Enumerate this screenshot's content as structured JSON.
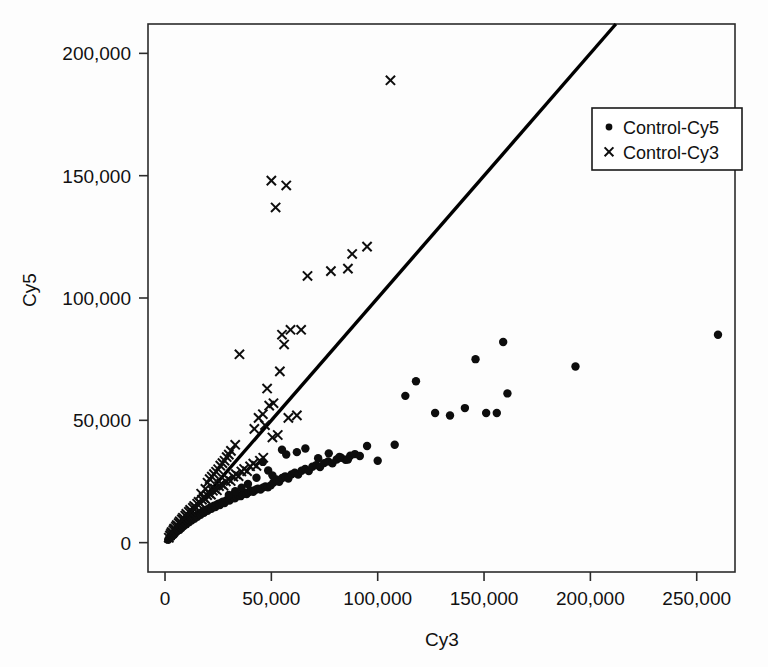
{
  "chart_data": {
    "type": "scatter",
    "title": "",
    "xlabel": "Cy3",
    "ylabel": "Cy5",
    "xlim": [
      -8000,
      268000
    ],
    "ylim": [
      -12000,
      212000
    ],
    "xticks": [
      0,
      50000,
      100000,
      150000,
      200000,
      250000
    ],
    "yticks": [
      0,
      50000,
      100000,
      150000,
      200000
    ],
    "xticklabels": [
      "0",
      "50,000",
      "100,000",
      "150,000",
      "200,000",
      "250,000"
    ],
    "yticklabels": [
      "0",
      "50,000",
      "100,000",
      "150,000",
      "200,000"
    ],
    "grid": false,
    "legend_position": "upper right",
    "reference_line": {
      "name": "identity-line",
      "slope": 1.0,
      "intercept": 0,
      "x_from": 0,
      "x_to": 212000
    },
    "series": [
      {
        "name": "Control-Cy5",
        "marker": "dot",
        "color": "#0d0d0d",
        "points": [
          [
            1500,
            1200
          ],
          [
            2000,
            1800
          ],
          [
            2400,
            2100
          ],
          [
            2800,
            2600
          ],
          [
            3100,
            2400
          ],
          [
            3400,
            3000
          ],
          [
            3700,
            3300
          ],
          [
            4000,
            3100
          ],
          [
            4300,
            3800
          ],
          [
            4600,
            4100
          ],
          [
            4900,
            3900
          ],
          [
            5200,
            4600
          ],
          [
            5500,
            4900
          ],
          [
            5800,
            4700
          ],
          [
            6100,
            5400
          ],
          [
            6500,
            5600
          ],
          [
            6800,
            5200
          ],
          [
            7100,
            6100
          ],
          [
            7400,
            6400
          ],
          [
            7800,
            6000
          ],
          [
            8100,
            6900
          ],
          [
            8500,
            7200
          ],
          [
            8800,
            6800
          ],
          [
            9200,
            7600
          ],
          [
            9600,
            7900
          ],
          [
            10000,
            7500
          ],
          [
            10400,
            8400
          ],
          [
            10800,
            8700
          ],
          [
            11200,
            8300
          ],
          [
            11600,
            9100
          ],
          [
            12000,
            9500
          ],
          [
            12400,
            9000
          ],
          [
            12900,
            9900
          ],
          [
            13300,
            10300
          ],
          [
            13800,
            9800
          ],
          [
            14200,
            10700
          ],
          [
            14700,
            11100
          ],
          [
            15200,
            10600
          ],
          [
            15700,
            11500
          ],
          [
            16200,
            11900
          ],
          [
            16700,
            11400
          ],
          [
            17200,
            12300
          ],
          [
            17800,
            12700
          ],
          [
            18300,
            12200
          ],
          [
            18900,
            13100
          ],
          [
            19400,
            13500
          ],
          [
            20000,
            13000
          ],
          [
            20600,
            13900
          ],
          [
            21200,
            14300
          ],
          [
            21800,
            13800
          ],
          [
            22400,
            14700
          ],
          [
            23100,
            15100
          ],
          [
            23700,
            14600
          ],
          [
            24400,
            15500
          ],
          [
            25100,
            15900
          ],
          [
            25800,
            15400
          ],
          [
            26500,
            16300
          ],
          [
            27200,
            16700
          ],
          [
            28000,
            16200
          ],
          [
            28700,
            17100
          ],
          [
            29500,
            17600
          ],
          [
            30300,
            17200
          ],
          [
            31100,
            18000
          ],
          [
            32000,
            18500
          ],
          [
            32800,
            18100
          ],
          [
            33700,
            18900
          ],
          [
            34600,
            19400
          ],
          [
            35500,
            19000
          ],
          [
            36500,
            19800
          ],
          [
            37400,
            20300
          ],
          [
            38400,
            19900
          ],
          [
            39400,
            20700
          ],
          [
            40500,
            21200
          ],
          [
            41500,
            20800
          ],
          [
            42600,
            21600
          ],
          [
            43700,
            22100
          ],
          [
            44900,
            21700
          ],
          [
            46000,
            22500
          ],
          [
            47200,
            23000
          ],
          [
            48400,
            22600
          ],
          [
            49700,
            23400
          ],
          [
            51000,
            24600
          ],
          [
            52300,
            25800
          ],
          [
            53700,
            24900
          ],
          [
            55100,
            26400
          ],
          [
            56500,
            27100
          ],
          [
            58000,
            26200
          ],
          [
            59500,
            27900
          ],
          [
            61000,
            28600
          ],
          [
            62600,
            27800
          ],
          [
            64200,
            29400
          ],
          [
            65900,
            30100
          ],
          [
            67600,
            29300
          ],
          [
            69300,
            31000
          ],
          [
            71100,
            31700
          ],
          [
            72900,
            30900
          ],
          [
            74800,
            32500
          ],
          [
            76700,
            33200
          ],
          [
            78700,
            32400
          ],
          [
            80700,
            34000
          ],
          [
            82800,
            34700
          ],
          [
            84900,
            33900
          ],
          [
            87100,
            35500
          ],
          [
            89300,
            36200
          ],
          [
            91600,
            35400
          ],
          [
            55000,
            38000
          ],
          [
            57000,
            36000
          ],
          [
            62000,
            37000
          ],
          [
            66000,
            38500
          ],
          [
            72000,
            34500
          ],
          [
            77000,
            36500
          ],
          [
            82000,
            35000
          ],
          [
            86000,
            34000
          ],
          [
            95000,
            39500
          ],
          [
            100000,
            33500
          ],
          [
            108000,
            40000
          ],
          [
            113000,
            60000
          ],
          [
            118000,
            66000
          ],
          [
            127000,
            53000
          ],
          [
            134000,
            52000
          ],
          [
            141000,
            55000
          ],
          [
            146000,
            75000
          ],
          [
            151000,
            53000
          ],
          [
            156000,
            53000
          ],
          [
            159000,
            82000
          ],
          [
            161000,
            61000
          ],
          [
            193000,
            72000
          ],
          [
            260000,
            85000
          ],
          [
            46000,
            33000
          ],
          [
            48500,
            29500
          ],
          [
            50500,
            27500
          ],
          [
            43000,
            26500
          ],
          [
            39000,
            24000
          ],
          [
            36000,
            22500
          ],
          [
            33000,
            21000
          ],
          [
            30000,
            19500
          ]
        ]
      },
      {
        "name": "Control-Cy3",
        "marker": "cross",
        "color": "#0d0d0d",
        "points": [
          [
            1800,
            2000
          ],
          [
            2300,
            2900
          ],
          [
            2700,
            3600
          ],
          [
            3100,
            4300
          ],
          [
            3500,
            4000
          ],
          [
            3900,
            5100
          ],
          [
            4300,
            5800
          ],
          [
            4700,
            5400
          ],
          [
            5100,
            6500
          ],
          [
            5500,
            7200
          ],
          [
            6000,
            6800
          ],
          [
            6400,
            8000
          ],
          [
            6900,
            8700
          ],
          [
            7400,
            8200
          ],
          [
            7900,
            9500
          ],
          [
            8400,
            10200
          ],
          [
            8900,
            9700
          ],
          [
            9500,
            11000
          ],
          [
            10000,
            11800
          ],
          [
            10600,
            11200
          ],
          [
            11200,
            12600
          ],
          [
            11800,
            13400
          ],
          [
            12400,
            12800
          ],
          [
            13100,
            14200
          ],
          [
            13700,
            15000
          ],
          [
            14400,
            14400
          ],
          [
            15100,
            15900
          ],
          [
            15800,
            16700
          ],
          [
            16600,
            16100
          ],
          [
            17400,
            17600
          ],
          [
            18200,
            18400
          ],
          [
            19000,
            17800
          ],
          [
            19800,
            19400
          ],
          [
            20700,
            20200
          ],
          [
            21600,
            19600
          ],
          [
            22500,
            21200
          ],
          [
            23400,
            22100
          ],
          [
            24400,
            21400
          ],
          [
            25400,
            23100
          ],
          [
            26400,
            24000
          ],
          [
            27500,
            23300
          ],
          [
            28600,
            25000
          ],
          [
            29700,
            26000
          ],
          [
            30900,
            25200
          ],
          [
            32100,
            27000
          ],
          [
            33300,
            28000
          ],
          [
            34600,
            27200
          ],
          [
            35900,
            29100
          ],
          [
            37200,
            30100
          ],
          [
            38600,
            29200
          ],
          [
            40000,
            31200
          ],
          [
            41500,
            32300
          ],
          [
            43000,
            31400
          ],
          [
            44600,
            33500
          ],
          [
            46200,
            34700
          ],
          [
            20000,
            24500
          ],
          [
            22000,
            27000
          ],
          [
            24000,
            29000
          ],
          [
            26000,
            31500
          ],
          [
            28000,
            33500
          ],
          [
            30000,
            36000
          ],
          [
            19000,
            22000
          ],
          [
            17000,
            20000
          ],
          [
            35000,
            77000
          ],
          [
            42000,
            46500
          ],
          [
            44000,
            51000
          ],
          [
            46000,
            52500
          ],
          [
            47000,
            48000
          ],
          [
            48000,
            63000
          ],
          [
            49000,
            56000
          ],
          [
            50000,
            148000
          ],
          [
            50500,
            43000
          ],
          [
            51000,
            57000
          ],
          [
            52000,
            137000
          ],
          [
            53000,
            44000
          ],
          [
            54000,
            70000
          ],
          [
            55000,
            85000
          ],
          [
            56000,
            81000
          ],
          [
            57000,
            146000
          ],
          [
            58000,
            51000
          ],
          [
            59000,
            87000
          ],
          [
            62000,
            52000
          ],
          [
            64000,
            87000
          ],
          [
            67000,
            109000
          ],
          [
            78000,
            111000
          ],
          [
            86000,
            112000
          ],
          [
            88000,
            118000
          ],
          [
            95000,
            121000
          ],
          [
            106000,
            189000
          ],
          [
            33000,
            40000
          ],
          [
            31000,
            37500
          ],
          [
            29000,
            35000
          ],
          [
            27000,
            32500
          ],
          [
            25000,
            30000
          ],
          [
            23000,
            28000
          ],
          [
            21000,
            26000
          ]
        ]
      }
    ]
  },
  "legend": {
    "entries": [
      {
        "label": "Control-Cy5",
        "marker": "dot"
      },
      {
        "label": "Control-Cy3",
        "marker": "cross"
      }
    ]
  }
}
